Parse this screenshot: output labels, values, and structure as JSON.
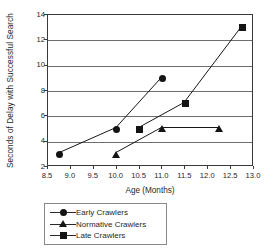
{
  "chart_data": {
    "type": "line",
    "title": "",
    "xlabel": "Age (Months)",
    "ylabel": "Seconds of Delay with Successful Search",
    "xlim": [
      8.5,
      13.0
    ],
    "ylim": [
      2,
      14
    ],
    "xticks": [
      "8.5",
      "9.0",
      "9.5",
      "10.0",
      "10.5",
      "11.0",
      "11.5",
      "12.0",
      "12.5",
      "13.0"
    ],
    "xtick_values": [
      8.5,
      9.0,
      9.5,
      10.0,
      10.5,
      11.0,
      11.5,
      12.0,
      12.5,
      13.0
    ],
    "yticks": [
      "2",
      "4",
      "6",
      "8",
      "10",
      "12",
      "14"
    ],
    "ytick_values": [
      2,
      4,
      6,
      8,
      10,
      12,
      14
    ],
    "grid": true,
    "grid_axis": "y",
    "legend_position": "below-plot-left",
    "series": [
      {
        "name": "Early Crawlers",
        "marker": "circle",
        "color": "#141414",
        "points": [
          {
            "x": 8.75,
            "y": 3
          },
          {
            "x": 10.0,
            "y": 5
          },
          {
            "x": 11.0,
            "y": 9
          }
        ]
      },
      {
        "name": "Normative Crawlers",
        "marker": "triangle",
        "color": "#141414",
        "points": [
          {
            "x": 10.0,
            "y": 3
          },
          {
            "x": 11.0,
            "y": 5
          },
          {
            "x": 12.25,
            "y": 5
          }
        ]
      },
      {
        "name": "Late Crawlers",
        "marker": "square",
        "color": "#141414",
        "points": [
          {
            "x": 10.5,
            "y": 5
          },
          {
            "x": 11.5,
            "y": 7
          },
          {
            "x": 12.75,
            "y": 13
          }
        ]
      }
    ]
  },
  "legend": {
    "items": [
      {
        "label": "Early Crawlers",
        "marker": "circle"
      },
      {
        "label": "Normative Crawlers",
        "marker": "triangle"
      },
      {
        "label": "Late Crawlers",
        "marker": "square"
      }
    ]
  },
  "axes": {
    "x_title": "Age (Months)",
    "y_title": "Seconds of Delay with Successful Search"
  }
}
